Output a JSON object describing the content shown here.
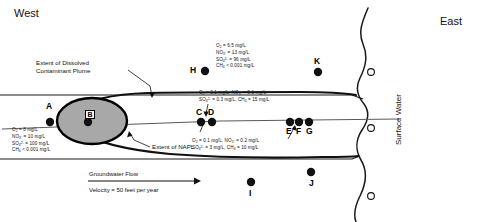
{
  "compass": {
    "west": "West",
    "east": "East"
  },
  "surface_water_label": "Surface Water",
  "plume_callout": {
    "line1": "Extent of Dissolved",
    "line2": "Contaminant Plume"
  },
  "napl_callout": "Extent of NAPL",
  "napl_zone_label": "B",
  "flow": {
    "title": "Groundwater Flow",
    "velocity": "Velocity = 50 feet per year"
  },
  "monitoring_points": [
    {
      "id": "A",
      "label": "A",
      "type": "filled",
      "x": 50,
      "y": 122,
      "lx": 46,
      "ly": 104
    },
    {
      "id": "B",
      "label": "B",
      "type": "filled",
      "x": 88,
      "y": 122,
      "lx": 84,
      "ly": 104
    },
    {
      "id": "C",
      "label": "C",
      "type": "filled",
      "x": 201,
      "y": 122,
      "lx": 196,
      "ly": 110
    },
    {
      "id": "D",
      "label": "D",
      "type": "filled",
      "x": 212,
      "y": 122,
      "lx": 208,
      "ly": 110
    },
    {
      "id": "E",
      "label": "E",
      "type": "filled",
      "x": 290,
      "y": 122,
      "lx": 286,
      "ly": 131
    },
    {
      "id": "F",
      "label": "F",
      "type": "filled",
      "x": 299,
      "y": 122,
      "lx": 295,
      "ly": 131
    },
    {
      "id": "G",
      "label": "G",
      "type": "filled",
      "x": 309,
      "y": 122,
      "lx": 305,
      "ly": 131
    },
    {
      "id": "H",
      "label": "H",
      "type": "filled",
      "x": 205,
      "y": 71,
      "lx": 191,
      "ly": 66
    },
    {
      "id": "I",
      "label": "I",
      "type": "filled",
      "x": 251,
      "y": 182,
      "lx": 249,
      "ly": 188
    },
    {
      "id": "J",
      "label": "J",
      "type": "filled",
      "x": 311,
      "y": 172,
      "lx": 309,
      "ly": 178
    },
    {
      "id": "K",
      "label": "K",
      "type": "filled",
      "x": 318,
      "y": 72,
      "lx": 314,
      "ly": 58
    }
  ],
  "surface_water_points": [
    {
      "id": "SW1",
      "type": "open",
      "x": 371,
      "y": 72
    },
    {
      "id": "SW2",
      "type": "open",
      "x": 371,
      "y": 128
    },
    {
      "id": "SW3",
      "type": "open",
      "x": 371,
      "y": 196
    }
  ],
  "chemistry": {
    "upgradient_A": {
      "o2": "O",
      "o2_sub": "2",
      "o2_val": " = 8 mg/L",
      "no3": "NO",
      "no3_sub": "3",
      "no3_sup": "-",
      "no3_val": " = 10 mg/L",
      "so4": "SO",
      "so4_sub": "4",
      "so4_sup": "2-",
      "so4_val": " = 100 mg/L",
      "ch4": "CH",
      "ch4_sub": "4",
      "ch4_val": " < 0.001 mg/L"
    },
    "background_H": {
      "o2": "O",
      "o2_sub": "2",
      "o2_val": " = 6.5 mg/L",
      "no3": "NO",
      "no3_sub": "3",
      "no3_sup": "-",
      "no3_val": " = 13 mg/L",
      "so4": "SO",
      "so4_sub": "4",
      "so4_sup": "2-",
      "so4_val": " = 96 mg/L",
      "ch4": "CH",
      "ch4_sub": "4",
      "ch4_val": " < 0.001 mg/L"
    },
    "plume_upper_CD": {
      "line1_a": "O",
      "line1_a_sub": "2",
      "line1_a_val": " = 0.1 mg/L,  ",
      "line1_b": "NO",
      "line1_b_sub": "3",
      "line1_b_sup": "-",
      "line1_b_val": " = 0.1 mg/L",
      "line2_a": "SO",
      "line2_a_sub": "4",
      "line2_a_sup": "2-",
      "line2_a_val": " = 0.3 mg/L,  ",
      "line2_b": "CH",
      "line2_b_sub": "4",
      "line2_b_val": " = 15 mg/L"
    },
    "plume_lower_EFG": {
      "line1_a": "O",
      "line1_a_sub": "2",
      "line1_a_val": " = 0.1 mg/L,  ",
      "line1_b": "NO",
      "line1_b_sub": "3",
      "line1_b_sup": "-",
      "line1_b_val": " = 0.2 mg/L",
      "line2_a": "SO",
      "line2_a_sub": "4",
      "line2_a_sup": "2-",
      "line2_a_val": " = 3 mg/L,  ",
      "line2_b": "CH",
      "line2_b_sub": "4",
      "line2_b_val": " = 10 mg/L"
    }
  },
  "colors": {
    "napl_fill": "#a8a8a8",
    "napl_stroke": "#000000",
    "plume_stroke": "#111111",
    "shore_stroke": "#1a1a1a",
    "centerline": "#5a5a5a",
    "point_fill": "#111111"
  }
}
